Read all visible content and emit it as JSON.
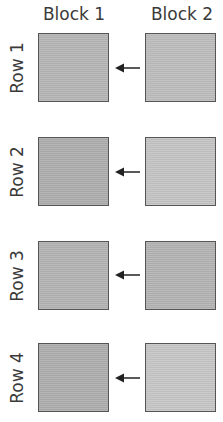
{
  "columns": [
    {
      "label": "Block 1"
    },
    {
      "label": "Block 2"
    }
  ],
  "rows": [
    {
      "label": "Row 1",
      "block1_color": "#b5b5b5",
      "block2_color": "#bcbcbc",
      "arrow": "left"
    },
    {
      "label": "Row 2",
      "block1_color": "#adadad",
      "block2_color": "#c4c4c4",
      "arrow": "left"
    },
    {
      "label": "Row 3",
      "block1_color": "#b3b3b3",
      "block2_color": "#b3b3b3",
      "arrow": "left"
    },
    {
      "label": "Row 4",
      "block1_color": "#adadad",
      "block2_color": "#c6c6c6",
      "arrow": "left"
    }
  ],
  "colors": {
    "border": "#555555",
    "text": "#3a3a3a",
    "arrow": "#222222"
  }
}
